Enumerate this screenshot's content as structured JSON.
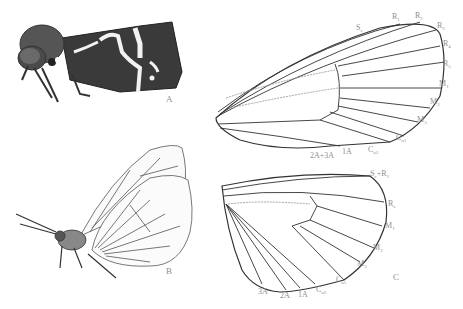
{
  "figure": {
    "panels": [
      {
        "id": "A",
        "label": "A",
        "subject": "moth-lateral-view"
      },
      {
        "id": "B",
        "label": "B",
        "subject": "butterfly-lateral-view"
      },
      {
        "id": "C",
        "label": "C",
        "subject": "wing-venation"
      }
    ],
    "forewing_veins": [
      {
        "base": "S",
        "sub": "c"
      },
      {
        "base": "R",
        "sub": "1"
      },
      {
        "base": "R",
        "sub": "2"
      },
      {
        "base": "R",
        "sub": "3"
      },
      {
        "base": "R",
        "sub": "4"
      },
      {
        "base": "R",
        "sub": "5"
      },
      {
        "base": "M",
        "sub": "1"
      },
      {
        "base": "M",
        "sub": "2"
      },
      {
        "base": "M",
        "sub": "3"
      },
      {
        "base": "C",
        "sub": "u1"
      },
      {
        "base": "C",
        "sub": "u2"
      },
      {
        "base": "1A",
        "sub": ""
      },
      {
        "base": "2A+3A",
        "sub": ""
      }
    ],
    "hindwing_veins": [
      {
        "base": "S",
        "sub": "c",
        "suffix": "+R",
        "suffix_sub": "1"
      },
      {
        "base": "R",
        "sub": "s"
      },
      {
        "base": "M",
        "sub": "1"
      },
      {
        "base": "M",
        "sub": "2"
      },
      {
        "base": "M",
        "sub": "3"
      },
      {
        "base": "C",
        "sub": "u1"
      },
      {
        "base": "C",
        "sub": "u2"
      },
      {
        "base": "1A",
        "sub": ""
      },
      {
        "base": "2A",
        "sub": ""
      },
      {
        "base": "3A",
        "sub": ""
      }
    ]
  }
}
